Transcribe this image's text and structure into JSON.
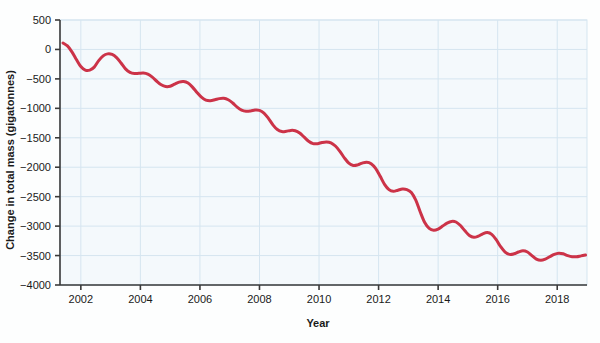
{
  "chart_data": {
    "type": "line",
    "title": "",
    "subtitle": "",
    "xlabel": "Year",
    "ylabel": "Change in total mass (gigatonnes)",
    "xlim": [
      2001.3,
      2019.0
    ],
    "ylim": [
      -4000,
      500
    ],
    "xticks": [
      2002,
      2004,
      2006,
      2008,
      2010,
      2012,
      2014,
      2016,
      2018
    ],
    "xtick_labels": [
      "2002",
      "2004",
      "2006",
      "2008",
      "2010",
      "2012",
      "2014",
      "2016",
      "2018"
    ],
    "yticks": [
      500,
      0,
      -500,
      -1000,
      -1500,
      -2000,
      -2500,
      -3000,
      -3500,
      -4000
    ],
    "ytick_labels": [
      "500",
      "0",
      "−500",
      "−1000",
      "−1500",
      "−2000",
      "−2500",
      "−3000",
      "−3500",
      "−4000"
    ],
    "grid": true,
    "grid_color": "#d5e5f0",
    "plot_bg": "#f4f9fc",
    "legend": null,
    "series": [
      {
        "name": "Change in total mass",
        "color": "#cc3348",
        "line_width": 3,
        "x": [
          2001.4,
          2001.55,
          2001.7,
          2001.85,
          2002.0,
          2002.15,
          2002.3,
          2002.45,
          2002.6,
          2002.75,
          2002.9,
          2003.05,
          2003.2,
          2003.35,
          2003.5,
          2003.65,
          2003.8,
          2003.95,
          2004.1,
          2004.25,
          2004.4,
          2004.55,
          2004.7,
          2004.85,
          2005.0,
          2005.15,
          2005.3,
          2005.45,
          2005.6,
          2005.75,
          2005.9,
          2006.05,
          2006.2,
          2006.35,
          2006.5,
          2006.65,
          2006.8,
          2006.95,
          2007.1,
          2007.25,
          2007.4,
          2007.55,
          2007.7,
          2007.85,
          2008.0,
          2008.15,
          2008.3,
          2008.45,
          2008.6,
          2008.75,
          2008.9,
          2009.05,
          2009.2,
          2009.35,
          2009.5,
          2009.65,
          2009.8,
          2009.95,
          2010.1,
          2010.25,
          2010.4,
          2010.55,
          2010.7,
          2010.85,
          2011.0,
          2011.15,
          2011.3,
          2011.45,
          2011.6,
          2011.75,
          2011.9,
          2012.05,
          2012.2,
          2012.35,
          2012.5,
          2012.65,
          2012.8,
          2012.95,
          2013.1,
          2013.25,
          2013.4,
          2013.55,
          2013.7,
          2013.85,
          2014.0,
          2014.15,
          2014.3,
          2014.45,
          2014.6,
          2014.75,
          2014.9,
          2015.05,
          2015.2,
          2015.35,
          2015.5,
          2015.65,
          2015.8,
          2015.95,
          2016.1,
          2016.25,
          2016.4,
          2016.55,
          2016.7,
          2016.85,
          2017.0,
          2017.15,
          2017.3,
          2017.45,
          2017.6,
          2017.75,
          2017.9,
          2018.05,
          2018.2,
          2018.35,
          2018.5,
          2018.65,
          2018.8,
          2018.95
        ],
        "y": [
          110,
          60,
          -40,
          -170,
          -290,
          -350,
          -350,
          -300,
          -190,
          -110,
          -75,
          -85,
          -140,
          -230,
          -330,
          -390,
          -410,
          -405,
          -400,
          -420,
          -470,
          -540,
          -600,
          -630,
          -625,
          -590,
          -555,
          -545,
          -570,
          -640,
          -730,
          -810,
          -860,
          -870,
          -855,
          -835,
          -830,
          -855,
          -910,
          -980,
          -1030,
          -1050,
          -1045,
          -1030,
          -1035,
          -1080,
          -1170,
          -1280,
          -1360,
          -1395,
          -1390,
          -1375,
          -1380,
          -1420,
          -1490,
          -1560,
          -1600,
          -1600,
          -1580,
          -1570,
          -1585,
          -1640,
          -1730,
          -1840,
          -1930,
          -1970,
          -1960,
          -1930,
          -1915,
          -1940,
          -2020,
          -2150,
          -2290,
          -2380,
          -2410,
          -2390,
          -2370,
          -2380,
          -2430,
          -2560,
          -2760,
          -2940,
          -3040,
          -3070,
          -3050,
          -3000,
          -2950,
          -2920,
          -2930,
          -2990,
          -3080,
          -3160,
          -3190,
          -3170,
          -3130,
          -3110,
          -3140,
          -3230,
          -3350,
          -3440,
          -3480,
          -3470,
          -3440,
          -3420,
          -3440,
          -3500,
          -3560,
          -3580,
          -3560,
          -3520,
          -3480,
          -3460,
          -3470,
          -3500,
          -3520,
          -3520,
          -3505,
          -3490
        ]
      }
    ]
  },
  "axes": {
    "y_axis_title": "Change in total mass (gigatonnes)",
    "x_axis_title": "Year"
  }
}
